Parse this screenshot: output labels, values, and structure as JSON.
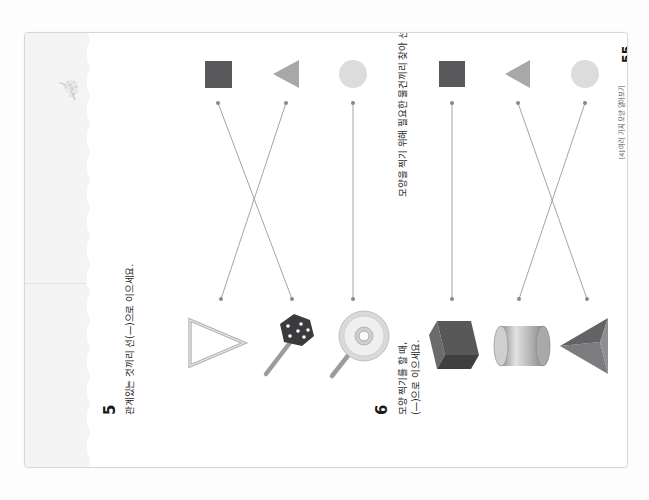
{
  "document": {
    "type": "korean-math-workbook-page",
    "page_number": "55",
    "footer_label": "[4] 여러 가지 모양 알아보기",
    "orientation": "rotated-90-ccw"
  },
  "problems": [
    {
      "number": "5",
      "instruction": "관계있는 것끼리 선(—)으로 이으세요.",
      "top_row": [
        {
          "name": "square",
          "label": "사각형",
          "color": "#59595b"
        },
        {
          "name": "triangle",
          "label": "삼각형",
          "color": "#a8a8a8"
        },
        {
          "name": "circle",
          "label": "원",
          "color": "#dcdcdc"
        }
      ],
      "bottom_row": [
        {
          "name": "triangle-instrument",
          "label": "트라이앵글"
        },
        {
          "name": "dice",
          "label": "주사위"
        },
        {
          "name": "compact-disc",
          "label": "시디"
        }
      ],
      "connections": [
        {
          "from": "square",
          "to": "dice"
        },
        {
          "from": "triangle",
          "to": "triangle-instrument"
        },
        {
          "from": "circle",
          "to": "compact-disc"
        }
      ]
    },
    {
      "number": "6",
      "instruction_line1": "모양 찍기를 할 때,",
      "instruction_line2": "모양을 찍기 위해 필요한 물건끼리 찾아 선",
      "instruction_line3": "(—)으로 이으세요.",
      "top_row": [
        {
          "name": "square",
          "label": "사각형",
          "color": "#59595b"
        },
        {
          "name": "triangle",
          "label": "삼각형",
          "color": "#a8a8a8"
        },
        {
          "name": "circle",
          "label": "원",
          "color": "#dcdcdc"
        }
      ],
      "bottom_row": [
        {
          "name": "cube",
          "label": "정육면체"
        },
        {
          "name": "cylinder",
          "label": "원기둥"
        },
        {
          "name": "triangular-pyramid",
          "label": "삼각뿔"
        }
      ],
      "connections": [
        {
          "from": "square",
          "to": "cube"
        },
        {
          "from": "triangle",
          "to": "triangular-pyramid"
        },
        {
          "from": "circle",
          "to": "cylinder"
        }
      ]
    }
  ],
  "colors": {
    "paper": "#ffffff",
    "scan_background": "#fdfdfd",
    "tear_strip": "#f4f4f4",
    "dark_shape": "#59595b",
    "mid_shape": "#a8a8a8",
    "light_shape": "#dcdcdc",
    "line": "#9a9a9a",
    "text": "#1c1c1c"
  }
}
